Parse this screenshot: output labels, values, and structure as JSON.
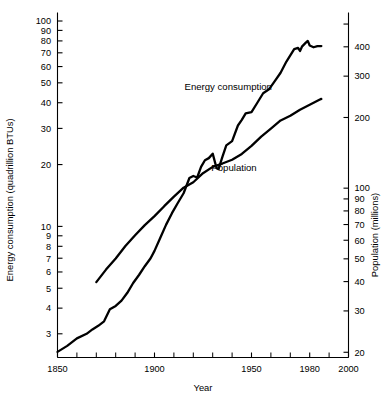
{
  "chart_data": {
    "type": "line",
    "title": "",
    "xlabel": "Year",
    "ylabel": "Energy consumption (quadrillion BTUs)",
    "y2label": "Population (millions)",
    "yscale": "log",
    "y2scale": "log",
    "xlim": [
      1850,
      2000
    ],
    "ylim": [
      2.3,
      110
    ],
    "y2lim": [
      19,
      560
    ],
    "grid": false,
    "legend": "inline-annotations",
    "xticks_major": [
      1850,
      1900,
      1950,
      1980,
      2000
    ],
    "xticks_minor": [
      1860,
      1870,
      1880,
      1890,
      1910,
      1920,
      1930,
      1940,
      1960,
      1970,
      1990
    ],
    "yticks": [
      3,
      4,
      5,
      6,
      7,
      8,
      9,
      10,
      20,
      30,
      40,
      50,
      60,
      70,
      80,
      90,
      100
    ],
    "ytick_labels": [
      "3",
      "4",
      "5",
      "6",
      "7",
      "8",
      "9",
      "10",
      "20",
      "30",
      "40",
      "50",
      "60",
      "70",
      "80",
      "90",
      "100"
    ],
    "y2ticks": [
      20,
      30,
      40,
      50,
      60,
      70,
      80,
      90,
      100,
      200,
      300,
      400,
      500
    ],
    "y2tick_labels": [
      "20",
      "30",
      "40",
      "50",
      "60",
      "70",
      "80",
      "90",
      "100",
      "200",
      "300",
      "400",
      ""
    ],
    "series": [
      {
        "name": "Energy consumption",
        "axis": "left",
        "units": "quadrillion BTUs",
        "label_x": 1938,
        "label_y": 46,
        "points": [
          [
            1850,
            2.45
          ],
          [
            1855,
            2.62
          ],
          [
            1860,
            2.85
          ],
          [
            1865,
            3.0
          ],
          [
            1868,
            3.15
          ],
          [
            1871,
            3.28
          ],
          [
            1874,
            3.45
          ],
          [
            1877,
            3.95
          ],
          [
            1880,
            4.1
          ],
          [
            1883,
            4.35
          ],
          [
            1886,
            4.75
          ],
          [
            1889,
            5.3
          ],
          [
            1892,
            5.8
          ],
          [
            1895,
            6.4
          ],
          [
            1898,
            7.0
          ],
          [
            1900,
            7.6
          ],
          [
            1903,
            8.8
          ],
          [
            1906,
            10.2
          ],
          [
            1909,
            11.6
          ],
          [
            1912,
            13.0
          ],
          [
            1915,
            14.5
          ],
          [
            1918,
            17.2
          ],
          [
            1920,
            17.6
          ],
          [
            1922,
            17.3
          ],
          [
            1924,
            19.5
          ],
          [
            1926,
            21.0
          ],
          [
            1928,
            21.5
          ],
          [
            1930,
            22.6
          ],
          [
            1932,
            19.2
          ],
          [
            1933,
            19.0
          ],
          [
            1935,
            21.8
          ],
          [
            1937,
            24.8
          ],
          [
            1940,
            26.0
          ],
          [
            1943,
            31.0
          ],
          [
            1945,
            33.0
          ],
          [
            1947,
            35.5
          ],
          [
            1950,
            36.0
          ],
          [
            1953,
            40.0
          ],
          [
            1956,
            44.5
          ],
          [
            1959,
            46.5
          ],
          [
            1962,
            51.0
          ],
          [
            1965,
            56.0
          ],
          [
            1968,
            63.5
          ],
          [
            1970,
            68.0
          ],
          [
            1972,
            73.0
          ],
          [
            1974,
            74.0
          ],
          [
            1975,
            71.5
          ],
          [
            1976,
            75.0
          ],
          [
            1978,
            78.5
          ],
          [
            1979,
            80.0
          ],
          [
            1980,
            76.0
          ],
          [
            1982,
            74.5
          ],
          [
            1984,
            75.5
          ],
          [
            1986,
            75.5
          ]
        ]
      },
      {
        "name": "Population",
        "axis": "right",
        "units": "millions",
        "label_x": 1941,
        "label_y": 118,
        "points": [
          [
            1870,
            39.8
          ],
          [
            1875,
            45.0
          ],
          [
            1880,
            50.2
          ],
          [
            1885,
            56.7
          ],
          [
            1890,
            63.0
          ],
          [
            1895,
            69.6
          ],
          [
            1900,
            76.0
          ],
          [
            1905,
            83.8
          ],
          [
            1910,
            92.0
          ],
          [
            1915,
            100.5
          ],
          [
            1920,
            106.0
          ],
          [
            1925,
            115.8
          ],
          [
            1930,
            123.2
          ],
          [
            1935,
            127.3
          ],
          [
            1940,
            132.1
          ],
          [
            1945,
            139.9
          ],
          [
            1950,
            151.3
          ],
          [
            1955,
            165.9
          ],
          [
            1960,
            179.3
          ],
          [
            1965,
            194.3
          ],
          [
            1970,
            203.3
          ],
          [
            1975,
            215.9
          ],
          [
            1980,
            226.5
          ],
          [
            1985,
            237.9
          ],
          [
            1986,
            240.0
          ]
        ]
      }
    ]
  },
  "axes": {
    "x_title": "Year",
    "y_left_title": "Energy consumption (quadrillion BTUs)",
    "y_right_title": "Population (millions)"
  },
  "annotations": {
    "energy_label": "Energy consumption",
    "population_label": "Population"
  }
}
